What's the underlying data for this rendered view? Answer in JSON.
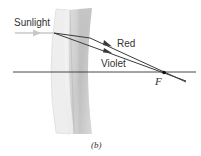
{
  "labels": {
    "sunlight": "Sunlight",
    "red": "Red",
    "violet": "Violet",
    "focal_point": "F",
    "caption": "(b)"
  },
  "colors": {
    "ray": "#3a3a3a",
    "axis": "#333333",
    "incoming_arrow": "#c8c8c8",
    "lens_light": "#e6e6e6",
    "lens_dark": "#bdbdbd",
    "text": "#333333"
  }
}
